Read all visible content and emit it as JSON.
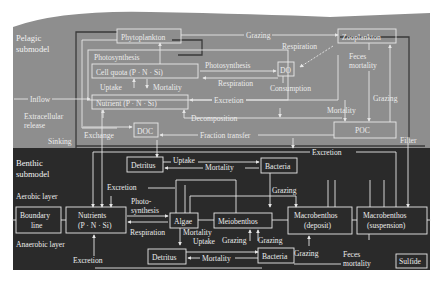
{
  "colors": {
    "pelagic_bg": "#8e8e8e",
    "benthic_bg": "#2a2a2a",
    "line": "#e6e6e6",
    "text": "#ececec"
  },
  "sections": {
    "pelagic": {
      "line1": "Pelagic",
      "line2": "submodel"
    },
    "benthic": {
      "line1": "Benthic",
      "line2": "submodel"
    }
  },
  "pelagic": {
    "boxes": {
      "phytoplankton": "Phytoplankton",
      "zooplankton": "Zooplankton",
      "photosynthesis": "Photosynthesis",
      "cell_quota": "Cell quota (P · N · Si)",
      "do": "DO",
      "nutrient": "Nutrient (P · N · Si)",
      "doc": "DOC",
      "poc": "POC"
    },
    "labels": {
      "grazing_top": "Grazing",
      "respiration_zoo": "Respiration",
      "photosynthesis_do": "Photosynthesis",
      "respiration_do": "Respiration",
      "feces_mortality_1": "Feces",
      "feces_mortality_2": "mortality",
      "uptake": "Uptake",
      "mortality": "Mortality",
      "consumption": "Consumption",
      "inflow": "Inflow",
      "excretion": "Excretion",
      "mortality_poc": "Mortality",
      "grazing_poc": "Grazing",
      "extracellular_1": "Extracellular",
      "extracellular_2": "release",
      "decomposition": "Decomposition",
      "sinking": "Sinking",
      "exchange": "Exchange",
      "fraction_transfer": "Fraction transfer",
      "filter": "Filter"
    }
  },
  "benthic": {
    "boxes": {
      "detritus_top": "Detritus",
      "bacteria_top": "Bacteria",
      "boundary_line_1": "Boundary",
      "boundary_line_2": "line",
      "nutrients_1": "Nutrients",
      "nutrients_2": "(P · N · Si)",
      "algae": "Algae",
      "meiobenthos": "Meiobenthos",
      "macro_deposit_1": "Macrobenthos",
      "macro_deposit_2": "(deposit)",
      "macro_suspension_1": "Macrobenthos",
      "macro_suspension_2": "(suspension)",
      "detritus_bottom": "Detritus",
      "bacteria_bottom": "Bacteria",
      "sulfide": "Sulfide"
    },
    "labels": {
      "uptake_top": "Uptake",
      "mortality_top": "Mortality",
      "excretion_top": "Excretion",
      "aerobic_layer": "Aerobic layer",
      "excretion_mid": "Excretion",
      "photo_1": "Photo-",
      "photo_2": "synthesis",
      "grazing_mid": "Grazing",
      "anaerobic_layer": "Anaerobic layer",
      "respiration": "Respiration",
      "mortality_algae": "Mortality",
      "uptake_bottom": "Uptake",
      "grazing_meio_1": "Grazing",
      "grazing_meio_2": "Grazing",
      "grazing_macro": "Grazing",
      "excretion_bottom": "Excretion",
      "mortality_bottom": "Mortality",
      "feces_1": "Feces",
      "feces_2": "mortality"
    }
  }
}
